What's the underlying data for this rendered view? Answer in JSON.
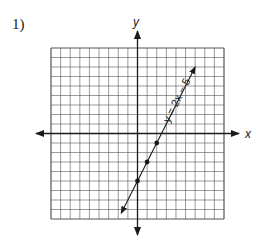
{
  "problem": {
    "number": "1)"
  },
  "chart_data": {
    "type": "line",
    "title": "",
    "xlabel": "x",
    "ylabel": "y",
    "xlim": [
      -9,
      9
    ],
    "ylim": [
      -9,
      9
    ],
    "grid": true,
    "series": [
      {
        "name": "y = 2x − 5",
        "equation": "y = 2x - 5",
        "slope": 2,
        "intercept": -5,
        "points": [
          [
            0,
            -5
          ],
          [
            1,
            -3
          ],
          [
            2,
            -1
          ]
        ],
        "x_range": [
          -1.7,
          6
        ]
      }
    ]
  },
  "labels": {
    "x_axis": "x",
    "y_axis": "y",
    "line": "y = 2x − 5"
  },
  "colors": {
    "ink": "#1a1a1a",
    "grid": "#555555"
  }
}
